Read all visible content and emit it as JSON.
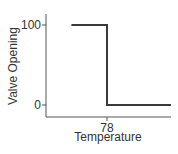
{
  "chart_data": {
    "type": "line",
    "title": "",
    "xlabel": "Temperature",
    "ylabel": "Valve Opening",
    "x_ticks": [
      {
        "value": 78,
        "label": "78"
      }
    ],
    "y_ticks": [
      {
        "value": 0,
        "label": "0"
      },
      {
        "value": 100,
        "label": "100"
      }
    ],
    "xlim": [
      72,
      88
    ],
    "ylim": [
      -15,
      115
    ],
    "grid": false,
    "legend": null,
    "series": [
      {
        "name": "Valve Opening",
        "step": true,
        "x": [
          73,
          78,
          78,
          87
        ],
        "y": [
          100,
          100,
          0,
          0
        ]
      }
    ]
  }
}
